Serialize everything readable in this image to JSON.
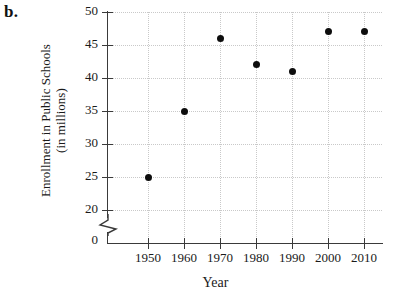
{
  "figure": {
    "part_label": "b."
  },
  "chart_data": {
    "type": "scatter",
    "title": "",
    "xlabel": "Year",
    "ylabel": "Enrollment in Public Schools",
    "ylabel_line2": "(in millions)",
    "x": [
      1950,
      1960,
      1970,
      1980,
      1990,
      2000,
      2010
    ],
    "values": [
      25,
      35,
      46,
      42,
      41,
      47,
      47
    ],
    "categories": [
      "1950",
      "1960",
      "1970",
      "1980",
      "1990",
      "2000",
      "2010"
    ],
    "xtick_labels": [
      "1950",
      "1960",
      "1970",
      "1980",
      "1990",
      "2000",
      "2010"
    ],
    "ytick_labels": [
      "50",
      "45",
      "40",
      "35",
      "30",
      "25",
      "20",
      "0"
    ],
    "ytick_values": [
      50,
      45,
      40,
      35,
      30,
      25,
      20,
      0
    ],
    "xlim": [
      1945,
      2015
    ],
    "ylim": [
      20,
      50
    ],
    "y_axis_break": true,
    "y_axis_break_between": [
      0,
      20
    ],
    "grid": true,
    "grid_style": "dotted",
    "legend": "none",
    "marker": "filled-circle",
    "marker_color": "#0d0d0d",
    "axis_color": "#3a3a3a",
    "grid_color": "#c9c9c9",
    "background": "#ffffff",
    "points": [
      {
        "x": 1950,
        "y": 25
      },
      {
        "x": 1960,
        "y": 35
      },
      {
        "x": 1970,
        "y": 46
      },
      {
        "x": 1980,
        "y": 42
      },
      {
        "x": 1990,
        "y": 41
      },
      {
        "x": 2000,
        "y": 47
      },
      {
        "x": 2010,
        "y": 47
      }
    ]
  }
}
